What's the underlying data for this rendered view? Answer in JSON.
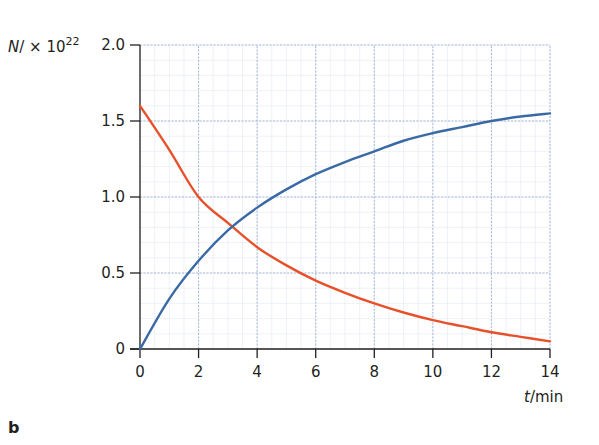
{
  "chart_data": {
    "type": "line",
    "title": "",
    "panel_label": "b",
    "xlabel": "t / min",
    "ylabel": "N / × 10^22",
    "xlim": [
      0,
      14
    ],
    "ylim": [
      0,
      2.0
    ],
    "x_ticks": [
      0,
      2,
      4,
      6,
      8,
      10,
      12,
      14
    ],
    "y_ticks": [
      0,
      0.5,
      1.0,
      1.5,
      2.0
    ],
    "y_tick_labels": [
      "0",
      "0.5",
      "1.0",
      "1.5",
      "2.0"
    ],
    "grid": true,
    "legend": null,
    "x": [
      0,
      1,
      2,
      3,
      4,
      5,
      6,
      7,
      8,
      9,
      10,
      11,
      12,
      13,
      14
    ],
    "series": [
      {
        "name": "decaying (parent nuclei)",
        "color": "#e8502a",
        "values": [
          1.6,
          1.31,
          1.0,
          0.83,
          0.67,
          0.55,
          0.45,
          0.37,
          0.3,
          0.24,
          0.19,
          0.15,
          0.11,
          0.08,
          0.05
        ]
      },
      {
        "name": "growing (daughter nuclei)",
        "color": "#3a6aa5",
        "values": [
          0.0,
          0.33,
          0.58,
          0.78,
          0.93,
          1.05,
          1.15,
          1.23,
          1.3,
          1.37,
          1.42,
          1.46,
          1.5,
          1.53,
          1.55
        ]
      }
    ],
    "annotations": [
      "crossing near t ≈ 3.3 min, N ≈ 0.8 × 10^22"
    ]
  },
  "labels": {
    "y_title_main": "N",
    "y_title_mid": "/ × 10",
    "y_title_exp": "22",
    "x_title_var": "t",
    "x_title_unit": "/min",
    "panel": "b"
  },
  "colors": {
    "axis": "#231f20",
    "grid": "#9fb3d6",
    "grid_minor": "#e3e8f2",
    "decay": "#e8502a",
    "growth": "#3a6aa5"
  }
}
